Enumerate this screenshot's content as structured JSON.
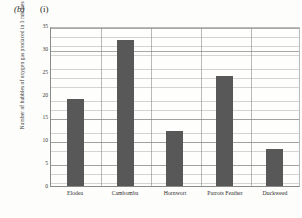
{
  "figure": {
    "part_label": "(b)",
    "sub_label": "(i)"
  },
  "chart_data": {
    "type": "bar",
    "title": "",
    "xlabel": "",
    "ylabel": "Number of bubbles of oxygen gas produced in 3 minutes",
    "categories": [
      "Elodea",
      "Cambomba",
      "Hornwort",
      "Parrots Feather",
      "Duckweed"
    ],
    "values": [
      19,
      32,
      12,
      24,
      8
    ],
    "ylim": [
      0,
      35
    ],
    "ytick_step": 5,
    "yticks": [
      0,
      5,
      10,
      15,
      20,
      25,
      30,
      35
    ],
    "grid": true,
    "grid_style": "graph-paper",
    "legend": "none",
    "bar_color": "#585858",
    "axis_color": "#8a8a8a"
  }
}
